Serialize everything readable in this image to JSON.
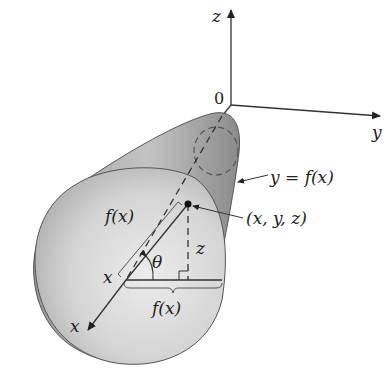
{
  "diagram": {
    "axes": {
      "z_label": "z",
      "y_label": "y",
      "x_label": "x",
      "origin_label": "0"
    },
    "labels": {
      "curve": "y = f(x)",
      "point": "(x, y, z)",
      "radius_slant": "f(x)",
      "radius_base": "f(x)",
      "height": "z",
      "angle": "θ",
      "x_position": "x"
    },
    "colors": {
      "surface_dark": "#8f8f8f",
      "surface_light": "#dcdcdc",
      "disk": "#d6d6d6",
      "stroke": "#333333"
    }
  }
}
